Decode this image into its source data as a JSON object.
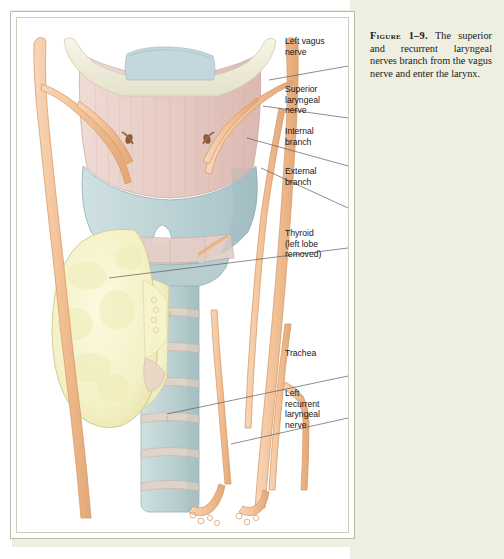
{
  "page": {
    "background_color": "#eeeee1",
    "frame_border_color": "#b7bdaa"
  },
  "caption": {
    "figure_label": "Figure 1–9.",
    "text": " The superior and recurrent laryngeal nerves branch from the vagus nerve and enter the larynx."
  },
  "labels": [
    {
      "id": "left-vagus-nerve",
      "text": "Left vagus\nnerve"
    },
    {
      "id": "superior-laryngeal-nerve",
      "text": "Superior\nlaryngeal\nnerve"
    },
    {
      "id": "internal-branch",
      "text": "Internal\nbranch"
    },
    {
      "id": "external-branch",
      "text": "External\nbranch"
    },
    {
      "id": "thyroid",
      "text": "Thyroid\n(left lobe\nremoved)"
    },
    {
      "id": "trachea",
      "text": "Trachea"
    },
    {
      "id": "left-recurrent-laryngeal-nerve",
      "text": "Left\nrecurrent\nlaryngeal\nnerve"
    }
  ],
  "illustration": {
    "title": "superior-and-recurrent-laryngeal-nerves-anatomy",
    "colors": {
      "nerve": "#f3c49c",
      "nerve_outline": "#d99a66",
      "cartilage_blue": "#bdd3d6",
      "cartilage_outline": "#94b1b6",
      "membrane_pink": "#e8cdc7",
      "hyoid_cream": "#efeede",
      "thyroid_gland": "#f6f3cd",
      "thyroid_outline": "#cfc98f",
      "leader_line": "#5b5b5b",
      "trachea_ring": "#e0cfc4"
    },
    "structures": [
      "hyoid-bone",
      "thyrohyoid-membrane",
      "thyroid-cartilage",
      "cricothyroid-membrane",
      "trachea",
      "thyroid-gland-right-lobe",
      "left-vagus-nerve-trunk",
      "right-vagus-nerve-trunk",
      "superior-laryngeal-nerve",
      "internal-laryngeal-branch",
      "external-laryngeal-branch",
      "recurrent-laryngeal-nerve"
    ]
  }
}
